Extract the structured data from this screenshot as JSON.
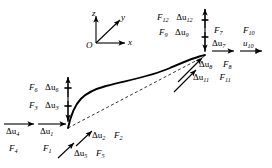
{
  "figure": {
    "type": "structural-element-free-body-diagram",
    "stroke_color": "#000000",
    "background_color": "#ffffff"
  },
  "axes": {
    "origin_label": "O",
    "x_label": "x",
    "y_label": "y",
    "z_label": "z"
  },
  "labels": {
    "f12": "F",
    "f12_sub": "12",
    "du12": "Δu",
    "du12_sub": "12",
    "f9": "F",
    "f9_sub": "9",
    "du9": "Δu",
    "du9_sub": "9",
    "f7": "F",
    "f7_sub": "7",
    "f10": "F",
    "f10_sub": "10",
    "du7": "Δu",
    "du7_sub": "7",
    "u10": "u",
    "u10_sub": "10",
    "du8": "Δu",
    "du8_sub": "8",
    "f8": "F",
    "f8_sub": "8",
    "du11": "Δu",
    "du11_sub": "11",
    "f11": "F",
    "f11_sub": "11",
    "f6": "F",
    "f6_sub": "6",
    "du6": "Δu",
    "du6_sub": "6",
    "f3": "F",
    "f3_sub": "3",
    "du3": "Δu",
    "du3_sub": "3",
    "du4": "Δu",
    "du4_sub": "4",
    "f4": "F",
    "f4_sub": "4",
    "du1": "Δu",
    "du1_sub": "1",
    "f1": "F",
    "f1_sub": "1",
    "du2": "Δu",
    "du2_sub": "2",
    "f2": "F",
    "f2_sub": "2",
    "du5": "Δu",
    "du5_sub": "5",
    "f5": "F",
    "f5_sub": "5"
  }
}
